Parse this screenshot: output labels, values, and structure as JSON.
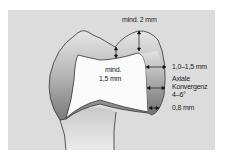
{
  "figure": {
    "background_color": "#dcdcdc",
    "labels": {
      "occlusal_min": "mind. 2 mm",
      "core_min_line1": "mind.",
      "core_min_line2": "1,5 mm",
      "axial_thickness": "1,0–1,5 mm",
      "convergence_line1": "Axiale",
      "convergence_line2": "Konvergenz",
      "convergence_line3": "4–6°",
      "margin_width": "0,8 mm"
    }
  }
}
